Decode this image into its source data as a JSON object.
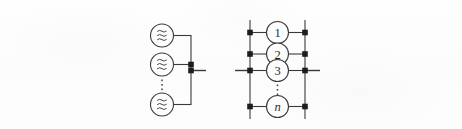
{
  "figure": {
    "type": "circuit-schematic",
    "background_color": "#fdfdfd",
    "line_color": "#3a3a3a",
    "node_color": "#1d1d1d",
    "panels": [
      {
        "id": "left-panel",
        "name": "parallel-sources-bus",
        "description": "Multiple identical sources connected in parallel to a common vertical bus with one output terminal",
        "source_symbol": "wave-source-icon",
        "source_count_shown": 3,
        "sources": [
          {
            "index": 1,
            "label": "",
            "symbol": "wave-source-icon"
          },
          {
            "index": 2,
            "label": "",
            "symbol": "wave-source-icon"
          },
          {
            "index": 3,
            "label": "",
            "symbol": "wave-source-icon"
          }
        ],
        "ellipsis": "vertical-ellipsis",
        "node_dots": 2,
        "terminal_stubs": 1
      },
      {
        "id": "right-panel",
        "name": "ladder-network",
        "description": "Ladder network: two vertical rails bridged by n numbered element rungs",
        "rungs": [
          {
            "label": "1"
          },
          {
            "label": "2"
          },
          {
            "label": "3"
          },
          {
            "label": "n"
          }
        ],
        "ellipsis": "vertical-ellipsis",
        "rails": 2,
        "node_dots": 8,
        "terminal_stubs": 2
      }
    ]
  },
  "colors": {
    "stroke": "#3a3a3a",
    "node": "#1d1d1d",
    "text": "#2a2a2a",
    "background": "#fdfdfd"
  }
}
